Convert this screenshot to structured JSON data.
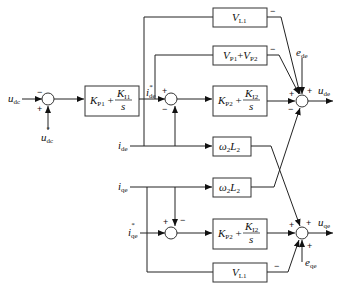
{
  "diagram": {
    "title": "",
    "inputs": {
      "udc": "u",
      "udc_sub": "dc",
      "udc_ref": "u",
      "udc_ref_sub": "dc",
      "idc": "i",
      "idc_sub": "de",
      "iqc": "i",
      "iqc_sub": "qe",
      "idc_ref": "i",
      "idc_ref_sub": "de",
      "iqc_ref": "i",
      "iqc_ref_sub": "qe",
      "ede": "e",
      "ede_sub": "de",
      "eqe": "e",
      "eqe_sub": "qe"
    },
    "outputs": {
      "ude": "u",
      "ude_sub": "de",
      "uqe": "u",
      "uqe_sub": "qe"
    },
    "blocks": {
      "pi_voltage": {
        "kp": "K",
        "kp_sub": "P1",
        "ki": "K",
        "ki_sub": "I1",
        "s": "s"
      },
      "pi_current_d": {
        "kp": "K",
        "kp_sub": "P2",
        "ki": "K",
        "ki_sub": "I2",
        "s": "s"
      },
      "pi_current_q": {
        "kp": "K",
        "kp_sub": "P2",
        "ki": "K",
        "ki_sub": "I2",
        "s": "s"
      },
      "vl1_top": {
        "v": "V",
        "v_sub": "L1"
      },
      "vp_sum": {
        "v1": "V",
        "v1_sub": "P1",
        "plus": "+",
        "v2": "V",
        "v2_sub": "P2"
      },
      "w2l2_d": {
        "w": "ω",
        "w_sub": "2",
        "l": "L",
        "l_sub": "2"
      },
      "w2l2_q": {
        "w": "ω",
        "w_sub": "2",
        "l": "L",
        "l_sub": "2"
      },
      "vl1_bottom": {
        "v": "V",
        "v_sub": "L1"
      }
    },
    "signs": {
      "sum1_top": "−",
      "sum1_bottom": "+",
      "sum2_top": "+",
      "sum2_bottom": "−",
      "sum3_vl1": "−",
      "sum3_vp": "−",
      "sum3_e": "+",
      "sum3_pi": "+",
      "sum3_w": "−",
      "sum4_top": "+",
      "sum4_right": "−",
      "sum5_pi": "+",
      "sum5_w": "+",
      "sum5_e": "+",
      "sum5_vl1": "−"
    }
  }
}
